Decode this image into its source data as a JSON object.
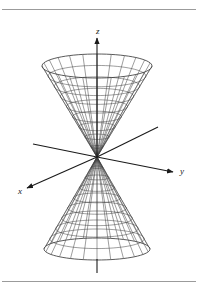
{
  "figure": {
    "background_color": "#ffffff",
    "rule_color": "#9b9b9b",
    "line_color": "#3c3c3c",
    "axis_color": "#1a1a1a",
    "width": 198,
    "height": 292
  },
  "axes": {
    "origin": {
      "x": 97,
      "y": 157
    },
    "z": {
      "label": "z",
      "label_x": 96,
      "label_y": 34,
      "tip": {
        "x": 97,
        "y": 38
      },
      "tail": {
        "x": 97,
        "y": 157
      },
      "stub_start": {
        "x": 97,
        "y": 259
      },
      "stub_end": {
        "x": 97,
        "y": 273
      },
      "arrow": "up"
    },
    "y": {
      "label": "y",
      "label_x": 180,
      "label_y": 174,
      "tip": {
        "x": 173,
        "y": 172
      },
      "back_end": {
        "x": 33,
        "y": 144
      },
      "arrow": "right-down"
    },
    "x": {
      "label": "x",
      "label_x": 18,
      "label_y": 194,
      "tip": {
        "x": 27,
        "y": 188
      },
      "back_end": {
        "x": 158,
        "y": 127
      },
      "arrow": "left-down"
    }
  },
  "cone": {
    "type": "double-elliptic-cone",
    "apex": {
      "x": 97,
      "y": 157
    },
    "meridian_count": 24,
    "parallel_count": 9,
    "upper": {
      "rim_center_y": 66,
      "rim_radius_x": 55,
      "rim_radius_y": 12,
      "description": "upper nappe, opens upward"
    },
    "lower": {
      "rim_center_y": 249,
      "rim_radius_x": 53,
      "rim_radius_y": 11,
      "description": "lower nappe, opens downward"
    }
  },
  "labels": {
    "z": "z",
    "y": "y",
    "x": "x"
  }
}
